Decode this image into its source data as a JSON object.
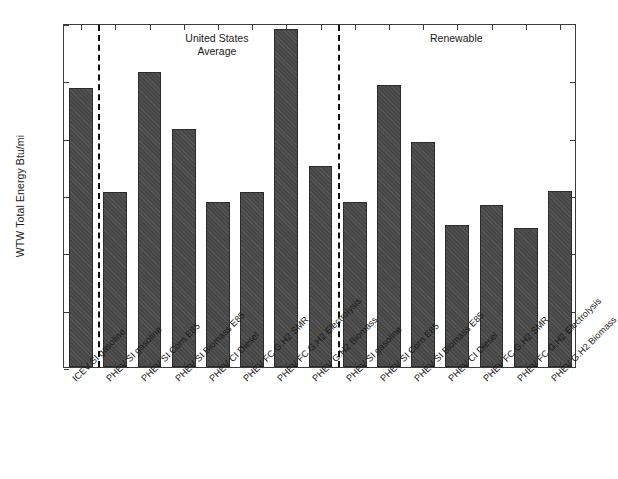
{
  "chart": {
    "type": "bar",
    "ylabel": "WTW Total Energy Btu/mi",
    "xlabel": "",
    "title": ""
  },
  "axis": {
    "yticks": [
      "0",
      "1,000",
      "2,000",
      "3,000",
      "4,000",
      "5,000",
      "6,000"
    ],
    "ymin": 0,
    "ymax": 6000
  },
  "annotations": {
    "group1": "United States\nAverage",
    "group2": "Renewable"
  },
  "chart_data": {
    "type": "bar",
    "title": "",
    "xlabel": "",
    "ylabel": "WTW Total Energy Btu/mi",
    "ylim": [
      0,
      6000
    ],
    "ytick_labels": [
      "0",
      "1,000",
      "2,000",
      "3,000",
      "4,000",
      "5,000",
      "6,000"
    ],
    "grid": false,
    "legend": null,
    "bar_color": "#4b4b4b",
    "bar_hatch": "diagonal",
    "group_annotations": [
      {
        "label": "United States Average",
        "after_category_index": 0
      },
      {
        "label": "Renewable",
        "after_category_index": 7
      }
    ],
    "dividers_after_index": [
      0,
      7
    ],
    "categories": [
      "ICEV SI gasoline",
      "PHEV SI gasoline",
      "PHEV SI Corn E85",
      "PHEV SI Biomass E85",
      "PHEV CI Diesel",
      "PHEV FC G.H2 SMR",
      "PHEV FC G.H2 Electrolysis",
      "PHEV G.H2 Biomass",
      "PHEV SI gasoline",
      "PHEV SI Corn E85",
      "PHEV SI Biomass E85",
      "PHEV CI Diesel",
      "PHEV FC G.H2 SMR",
      "PHEV FC G.H2 Electrolysis",
      "PHEV G.H2 Biomass"
    ],
    "values": [
      4860,
      3050,
      5140,
      4150,
      2870,
      3060,
      5900,
      3510,
      2870,
      4920,
      3930,
      2480,
      2820,
      2430,
      3070
    ]
  }
}
